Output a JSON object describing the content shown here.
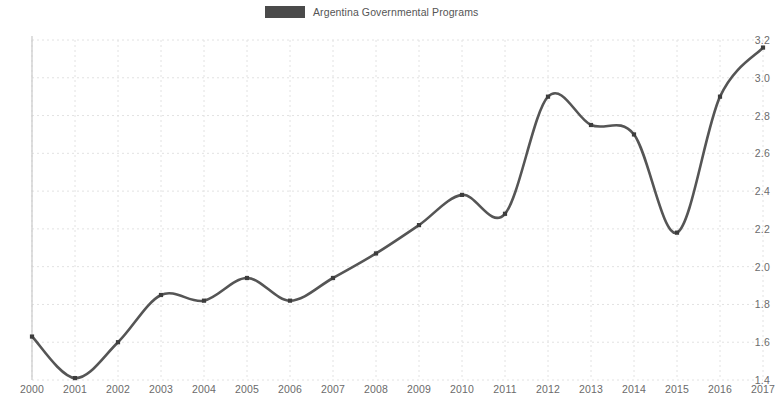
{
  "legend": {
    "label": "Argentina Governmental Programs",
    "swatch_color": "#4a4a4a",
    "position": "top-center"
  },
  "axis": {
    "y_ticks": [
      "1.4",
      "1.6",
      "1.8",
      "2.0",
      "2.2",
      "2.4",
      "2.6",
      "2.8",
      "3.0",
      "3.2"
    ],
    "x_ticks": [
      "2000",
      "2001",
      "2002",
      "2003",
      "2004",
      "2005",
      "2006",
      "2007",
      "2008",
      "2009",
      "2010",
      "2011",
      "2012",
      "2013",
      "2014",
      "2015",
      "2016",
      "2017"
    ]
  },
  "style": {
    "line_color": "#555555",
    "marker_color": "#3d3d3d",
    "grid_color": "#e2e2e2",
    "axis_color": "#c9c9c9",
    "background": "#ffffff",
    "tick_text_color": "#6b6b6b"
  },
  "chart_data": {
    "type": "line",
    "title": "",
    "subtitle": "",
    "xlabel": "",
    "ylabel": "",
    "xlim": [
      2000,
      2017
    ],
    "ylim": [
      1.4,
      3.2
    ],
    "ytick_step": 0.2,
    "grid": true,
    "legend_position": "top-center",
    "smoothed": true,
    "markers": "square",
    "x": [
      2000,
      2001,
      2002,
      2003,
      2004,
      2005,
      2006,
      2007,
      2008,
      2009,
      2010,
      2011,
      2012,
      2013,
      2014,
      2015,
      2016,
      2017
    ],
    "series": [
      {
        "name": "Argentina Governmental Programs",
        "color": "#555555",
        "values": [
          1.63,
          1.41,
          1.6,
          1.85,
          1.82,
          1.94,
          1.82,
          1.94,
          2.07,
          2.22,
          2.38,
          2.28,
          2.9,
          2.75,
          2.7,
          2.18,
          2.9,
          3.16
        ]
      }
    ]
  }
}
